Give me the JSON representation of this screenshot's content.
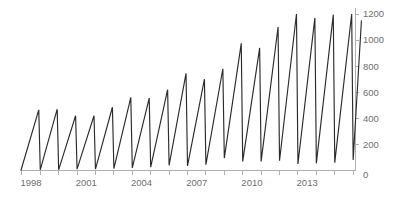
{
  "chart_data": {
    "type": "line",
    "title": "",
    "subtitle": "",
    "xlabel": "",
    "ylabel": "",
    "grid": false,
    "legend": false,
    "legend_position": "none",
    "y_axis_side": "right",
    "xlim": [
      1997.4,
      2015.6
    ],
    "ylim": [
      0,
      1200
    ],
    "yticks": [
      0,
      200,
      400,
      600,
      800,
      1000,
      1200
    ],
    "ytick_labels": [
      "0",
      "200",
      "400",
      "600",
      "800",
      "1000",
      "1200"
    ],
    "xtick_labels": [
      "1998",
      "2001",
      "2004",
      "2007",
      "2010",
      "2013"
    ],
    "xtick_values": [
      1998,
      2001,
      2004,
      2007,
      2010,
      2013
    ],
    "xtick_minor_values": [
      1997.5,
      1998.5,
      1999.5,
      2000.5,
      2001.5,
      2002.5,
      2003.5,
      2004.5,
      2005.5,
      2006.5,
      2007.5,
      2008.5,
      2009.5,
      2010.5,
      2011.5,
      2012.5,
      2013.5,
      2014.5,
      2015.5
    ],
    "line_color": "#2b2b2b",
    "axis_color": "#b0b0b0",
    "tick_label_color": "#6e6e6e",
    "series": [
      {
        "name": "value",
        "points": [
          [
            1997.45,
            0
          ],
          [
            1998.42,
            465
          ],
          [
            1998.5,
            5
          ],
          [
            1999.42,
            470
          ],
          [
            1999.5,
            5
          ],
          [
            2000.42,
            420
          ],
          [
            2000.5,
            10
          ],
          [
            2001.42,
            420
          ],
          [
            2001.5,
            10
          ],
          [
            2002.42,
            485
          ],
          [
            2002.5,
            15
          ],
          [
            2003.42,
            560
          ],
          [
            2003.5,
            20
          ],
          [
            2004.42,
            555
          ],
          [
            2004.5,
            25
          ],
          [
            2005.42,
            620
          ],
          [
            2005.5,
            40
          ],
          [
            2006.42,
            745
          ],
          [
            2006.5,
            35
          ],
          [
            2007.42,
            700
          ],
          [
            2007.5,
            45
          ],
          [
            2008.42,
            780
          ],
          [
            2008.5,
            95
          ],
          [
            2009.42,
            975
          ],
          [
            2009.5,
            70
          ],
          [
            2010.42,
            940
          ],
          [
            2010.5,
            70
          ],
          [
            2011.42,
            1100
          ],
          [
            2011.5,
            75
          ],
          [
            2012.42,
            1200
          ],
          [
            2012.5,
            50
          ],
          [
            2013.42,
            1170
          ],
          [
            2013.5,
            55
          ],
          [
            2014.42,
            1195
          ],
          [
            2014.5,
            60
          ],
          [
            2015.42,
            1200
          ],
          [
            2015.5,
            80
          ],
          [
            2015.95,
            1150
          ]
        ]
      }
    ]
  }
}
